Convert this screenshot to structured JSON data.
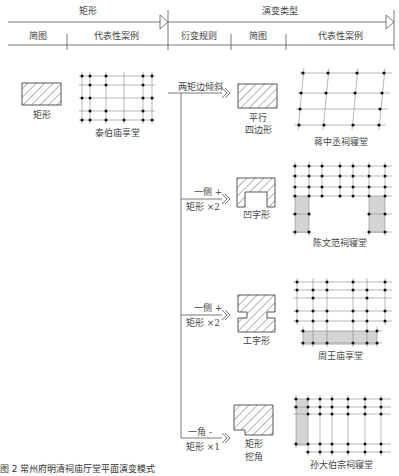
{
  "header": {
    "group1": {
      "title": "矩形",
      "cols": [
        "简图",
        "代表性案例"
      ]
    },
    "group2": {
      "title": "演变类型",
      "cols": [
        "衍变规则",
        "简图",
        "代表性案例"
      ]
    }
  },
  "origin": {
    "shape_label": "矩形",
    "case_label": "泰伯庙享堂"
  },
  "branches": [
    {
      "rule_line1": "两矩边倾斜",
      "rule_line2": "",
      "shape_label_line1": "平行",
      "shape_label_line2": "四边形",
      "case_label": "蒋中丞祠寝堂"
    },
    {
      "rule_line1": "一侧 +",
      "rule_line2": "矩形 ×2",
      "shape_label_line1": "凹字形",
      "shape_label_line2": "",
      "case_label": "陈文范祠寝堂"
    },
    {
      "rule_line1": "一侧 +",
      "rule_line2": "矩形 ×2",
      "shape_label_line1": "工字形",
      "shape_label_line2": "",
      "case_label": "周王庙享堂"
    },
    {
      "rule_line1": "一角 -",
      "rule_line2": "矩形 ×1",
      "shape_label_line1": "矩形",
      "shape_label_line2": "挖角",
      "case_label": "孙大伯宗祠寝堂"
    }
  ],
  "caption": "图 2   常州府明清祠庙厅堂平面演变模式",
  "colors": {
    "line": "#555555",
    "shade": "#d4d4d4",
    "dot": "#111111"
  }
}
